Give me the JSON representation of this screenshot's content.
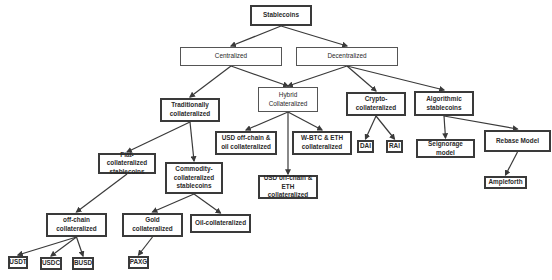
{
  "diagram": {
    "title": "Stablecoins",
    "nodes": {
      "root": "Stablecoins",
      "centralized": "Centralized",
      "decentralized": "Decentralized",
      "traditional": "Traditionally\ncollateralized",
      "hybrid": "Hybrid\nCollateralized",
      "crypto": "Crypto-\ncollateralized",
      "algorithmic": "Algorithmic\nstablecoins",
      "fiat": "Fiat-collateralized\nstablecoins",
      "commodity": "Commodity-\ncollateralized\nstablecoins",
      "usd_oil": "USD off-chain &\noil collateralized",
      "wbtc_eth": "W-BTC & ETH\ncollateralized",
      "usd_eth": "USD off-chain &\nETH collateralized",
      "dai": "DAI",
      "rai": "RAI",
      "seignorage": "Seignorage model",
      "rebase": "Rebase Model",
      "ampleforth": "Ampleforth",
      "offchain": "off-chain\ncollateralized",
      "gold": "Gold\ncollateralized",
      "oil": "Oil-collateralized",
      "usdt": "USDT",
      "usdc": "USDC",
      "busd": "BUSD",
      "paxg": "PAXG"
    },
    "edges": [
      [
        "root",
        "centralized"
      ],
      [
        "root",
        "decentralized"
      ],
      [
        "centralized",
        "traditional"
      ],
      [
        "centralized",
        "hybrid"
      ],
      [
        "decentralized",
        "hybrid"
      ],
      [
        "decentralized",
        "crypto"
      ],
      [
        "decentralized",
        "algorithmic"
      ],
      [
        "traditional",
        "fiat"
      ],
      [
        "traditional",
        "commodity"
      ],
      [
        "hybrid",
        "usd_oil"
      ],
      [
        "hybrid",
        "usd_eth"
      ],
      [
        "hybrid",
        "wbtc_eth"
      ],
      [
        "crypto",
        "dai"
      ],
      [
        "crypto",
        "rai"
      ],
      [
        "algorithmic",
        "seignorage"
      ],
      [
        "algorithmic",
        "rebase"
      ],
      [
        "rebase",
        "ampleforth"
      ],
      [
        "fiat",
        "offchain"
      ],
      [
        "commodity",
        "gold"
      ],
      [
        "commodity",
        "oil"
      ],
      [
        "offchain",
        "usdt"
      ],
      [
        "offchain",
        "usdc"
      ],
      [
        "offchain",
        "busd"
      ],
      [
        "gold",
        "paxg"
      ]
    ],
    "colors": {
      "border": "#3a3a3a",
      "line": "#3a3a3a",
      "text": "#2a2a2a",
      "background": "#ffffff"
    }
  }
}
